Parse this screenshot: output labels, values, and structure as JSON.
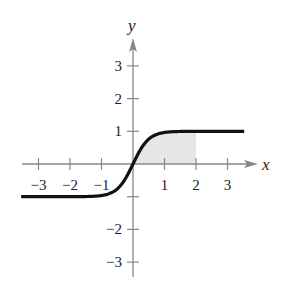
{
  "chart_data": {
    "type": "line",
    "title": "",
    "xlabel": "x",
    "ylabel": "y",
    "xlim": [
      -3.6,
      3.8
    ],
    "ylim": [
      -3.4,
      3.8
    ],
    "x_ticks": [
      -3,
      -2,
      -1,
      1,
      2,
      3
    ],
    "y_ticks": [
      3,
      2,
      1,
      -2,
      -3
    ],
    "x_tick_labels": [
      "−3",
      "−2",
      "−1",
      "1",
      "2",
      "3"
    ],
    "y_tick_labels": [
      "3",
      "2",
      "1",
      "−2",
      "−3"
    ],
    "grid": false,
    "series": [
      {
        "name": "y = tanh(2x)",
        "function": "tanh(2x)",
        "x_range": [
          -3.5,
          3.5
        ],
        "color": "#111111"
      }
    ],
    "shaded_region": {
      "x_from": 0,
      "x_to": 2,
      "under": "curve",
      "color": "#e6e6e6"
    }
  },
  "axes": {
    "x_label": "x",
    "y_label": "y",
    "axis_color": "#888888"
  }
}
